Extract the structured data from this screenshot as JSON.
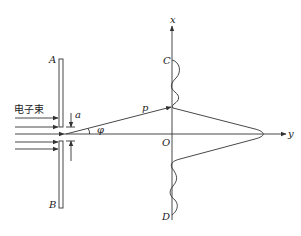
{
  "figure": {
    "labels": {
      "beam": "电子束",
      "plate_top": "A",
      "plate_bottom": "B",
      "slit_width": "a",
      "momentum": "p",
      "angle": "φ",
      "x_axis": "x",
      "y_axis": "y",
      "origin": "O",
      "point_c": "C",
      "point_d": "D"
    },
    "colors": {
      "line": "#333333",
      "background": "#ffffff"
    }
  }
}
